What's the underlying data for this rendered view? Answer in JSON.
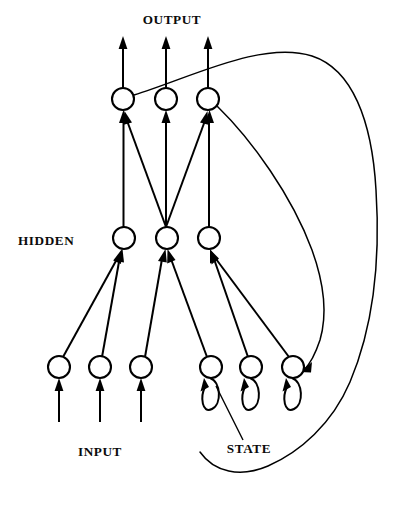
{
  "figure": {
    "background_color": "#ffffff",
    "ink_color": "#000000"
  },
  "labels": {
    "output": "OUTPUT",
    "hidden": "HIDDEN",
    "input": "INPUT",
    "state": "STATE"
  },
  "layers": {
    "output": {
      "name": "output-layer",
      "label": "OUTPUT",
      "count": 3,
      "radius": 11,
      "y": 99,
      "x_positions": [
        123,
        166,
        208
      ]
    },
    "hidden": {
      "name": "hidden-layer",
      "label": "HIDDEN",
      "count": 3,
      "radius": 11,
      "y": 238,
      "x_positions": [
        124,
        167,
        209
      ]
    },
    "input": {
      "name": "input-layer",
      "label": "INPUT",
      "count": 3,
      "radius": 11,
      "y": 367,
      "x_positions": [
        59,
        100,
        141
      ]
    },
    "state": {
      "name": "state-layer",
      "label": "STATE",
      "count": 3,
      "radius": 11,
      "y": 367,
      "x_positions": [
        211,
        251,
        293
      ],
      "self_loops": true
    }
  },
  "connections": {
    "hidden_to_output": [
      {
        "from": "hidden-1",
        "to": "output-1"
      },
      {
        "from": "hidden-2",
        "to": "output-1"
      },
      {
        "from": "hidden-2",
        "to": "output-2"
      },
      {
        "from": "hidden-2",
        "to": "output-3"
      },
      {
        "from": "hidden-3",
        "to": "output-3"
      }
    ],
    "input_to_hidden": [
      {
        "from": "input-1",
        "to": "hidden-1"
      },
      {
        "from": "input-2",
        "to": "hidden-1"
      },
      {
        "from": "input-3",
        "to": "hidden-2"
      },
      {
        "from": "state-1",
        "to": "hidden-2"
      },
      {
        "from": "state-2",
        "to": "hidden-3"
      },
      {
        "from": "state-3",
        "to": "hidden-3"
      }
    ],
    "recurrent": [
      {
        "from": "output-1",
        "to": "state-3",
        "style": "long-curve-outer"
      },
      {
        "from": "output-3",
        "to": "state-3",
        "style": "long-curve-inner"
      }
    ],
    "self_loops": [
      {
        "node": "state-1"
      },
      {
        "node": "state-2"
      },
      {
        "node": "state-3"
      }
    ],
    "external_outputs": [
      {
        "from": "output-1",
        "direction": "up"
      },
      {
        "from": "output-2",
        "direction": "up"
      },
      {
        "from": "output-3",
        "direction": "up"
      }
    ],
    "external_inputs": [
      {
        "to": "input-1",
        "direction": "up"
      },
      {
        "to": "input-2",
        "direction": "up"
      },
      {
        "to": "input-3",
        "direction": "up"
      }
    ]
  },
  "label_positions": {
    "output": {
      "x": 172,
      "y": 24
    },
    "hidden": {
      "x": 53,
      "y": 245
    },
    "input": {
      "x": 100,
      "y": 456
    },
    "state": {
      "x": 249,
      "y": 453
    }
  }
}
